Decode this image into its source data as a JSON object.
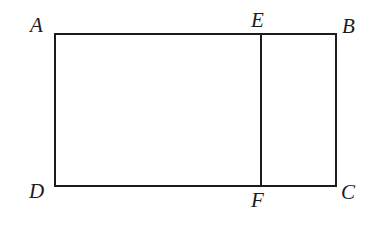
{
  "figure": {
    "kind": "geometry-diagram",
    "background_color": "#ffffff",
    "stroke_color": "#1c1c1c",
    "stroke_width": 2,
    "rectangle": {
      "left": 55,
      "top": 34,
      "right": 336,
      "bottom": 186,
      "width": 281,
      "height": 152
    },
    "divider": {
      "name": "segment-EF",
      "x": 261,
      "y_top": 34,
      "y_bottom": 186
    },
    "vertices": [
      {
        "id": "A",
        "label": "A",
        "corner": "top-left",
        "x": 55,
        "y": 34,
        "label_x": 30,
        "label_y": 15
      },
      {
        "id": "B",
        "label": "B",
        "corner": "top-right",
        "x": 336,
        "y": 34,
        "label_x": 342,
        "label_y": 16
      },
      {
        "id": "C",
        "label": "C",
        "corner": "bottom-right",
        "x": 336,
        "y": 186,
        "label_x": 341,
        "label_y": 182
      },
      {
        "id": "D",
        "label": "D",
        "corner": "bottom-left",
        "x": 55,
        "y": 186,
        "label_x": 29,
        "label_y": 181
      },
      {
        "id": "E",
        "label": "E",
        "corner": "top-divider",
        "x": 261,
        "y": 34,
        "label_x": 251,
        "label_y": 10
      },
      {
        "id": "F",
        "label": "F",
        "corner": "bottom-divider",
        "x": 261,
        "y": 186,
        "label_x": 251,
        "label_y": 190
      }
    ]
  }
}
